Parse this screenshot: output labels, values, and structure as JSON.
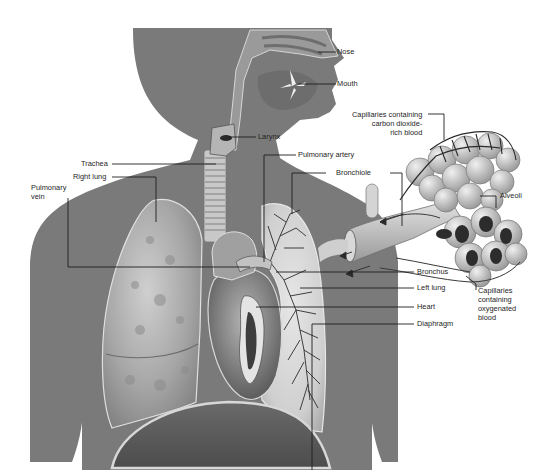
{
  "diagram": {
    "colors": {
      "background": "#ffffff",
      "body_silhouette": "#7a7a7a",
      "lung_fill": "#a9a9a9",
      "lung_highlight": "#d2d2d2",
      "heart_fill": "#8a8a8a",
      "airway": "#c8c8c8",
      "leader_line": "#1e1e1e",
      "label_text": "#1e1e1e"
    },
    "labels": {
      "nose": "Nose",
      "mouth": "Mouth",
      "larynx": "Larynx",
      "trachea": "Trachea",
      "pulmonary_artery": "Pulmonary artery",
      "right_lung": "Right lung",
      "pulmonary_vein": "Pulmonary\nvein",
      "bronchiole": "Bronchiole",
      "capillaries_co2": "Capillaries containing\ncarbon dioxide-\nrich blood",
      "alveoli": "Alveoli",
      "bronchus": "Bronchus",
      "left_lung": "Left lung",
      "capillaries_o2": "Capillaries\ncontaining\noxygenated\nblood",
      "heart": "Heart",
      "diaphragm": "Diaphragm"
    }
  }
}
